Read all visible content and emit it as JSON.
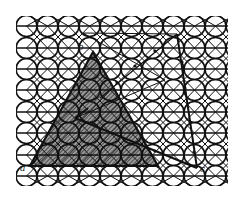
{
  "figure": {
    "colors": {
      "ink": "#111111",
      "hatch": "#333333",
      "background": "#ffffff"
    },
    "lattice": {
      "x_start": 16,
      "x_end": 228,
      "y_start": 16,
      "y_end": 186,
      "row_lines_y": [
        26,
        48,
        69,
        90,
        112,
        133,
        155,
        176
      ],
      "circle_spacing": 21,
      "circle_radius": 10.5
    },
    "shaded_triangle": {
      "points": [
        [
          93,
          52
        ],
        [
          30,
          166
        ],
        [
          158,
          166
        ]
      ]
    },
    "outline_triangle": {
      "points": [
        [
          83,
          33
        ],
        [
          177,
          34
        ],
        [
          197,
          168
        ]
      ]
    },
    "labels": {
      "a": "a",
      "b": "b",
      "c": "c"
    }
  }
}
